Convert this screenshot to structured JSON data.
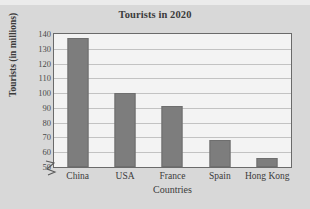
{
  "chart_data": {
    "type": "bar",
    "title": "Tourists in 2020",
    "xlabel": "Countries",
    "ylabel": "Tourists (in millions)",
    "categories": [
      "China",
      "USA",
      "France",
      "Spain",
      "Hong Kong"
    ],
    "values": [
      137,
      100,
      91,
      68,
      56
    ],
    "ylim": [
      50,
      140
    ],
    "ytick_step": 10,
    "yticks": [
      50,
      60,
      70,
      80,
      90,
      100,
      110,
      120,
      130,
      140
    ],
    "grid": true,
    "axis_break": true,
    "axis_break_icon": "zigzag-break-icon",
    "legend": null,
    "legend_position": "none",
    "colors": {
      "bar_fill": "#7d7d7d",
      "bar_stroke": "#6e6e6e",
      "plot_background": "#f3f3f3",
      "figure_background": "#d8d8d8",
      "gridline": "#c2c2c2",
      "frame": "#6a6a6a",
      "text": "#3b3b3b"
    }
  }
}
